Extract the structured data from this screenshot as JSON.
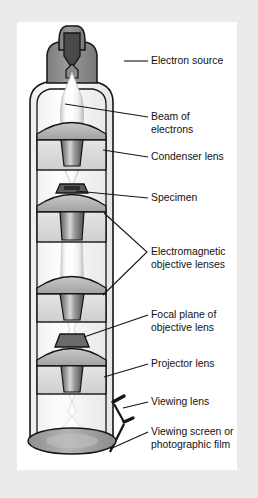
{
  "figure": {
    "panel_background": "#ffffff",
    "page_background": "#ebebeb",
    "ink_color": "#151515"
  },
  "palette": {
    "ink": "#151515",
    "panel": "#ffffff",
    "page": "#ebebeb",
    "housing_gray": "#8c8c8c",
    "filament_dark": "#4a4a4a",
    "lens_block": "#d6d6d6",
    "lens_block_shadow": "#b9b9b9",
    "dome_gray": "#b5b5b5",
    "bore_dark": "#6e6e6e",
    "beam_light": "#f4f4f4",
    "screen_gray": "#9a9a9a",
    "column_wall": "#f7f7f7"
  },
  "labels": [
    {
      "id": "electron-source",
      "lines": [
        "Electron source"
      ],
      "text_x": 151,
      "text_y": 64,
      "leader": "M124,61 L148,61"
    },
    {
      "id": "beam-of-electrons",
      "lines": [
        "Beam of",
        "electrons"
      ],
      "text_x": 151,
      "text_y": 120,
      "leader": "M65,104 L148,117"
    },
    {
      "id": "condenser-lens",
      "lines": [
        "Condenser lens"
      ],
      "text_x": 151,
      "text_y": 160,
      "leader": "M103,150 L148,157"
    },
    {
      "id": "specimen",
      "lines": [
        "Specimen"
      ],
      "text_x": 151,
      "text_y": 201,
      "leader": "M76,191 L148,198"
    },
    {
      "id": "electromagnetic-objective-lenses",
      "lines": [
        "Electromagnetic",
        "objective lenses"
      ],
      "text_x": 151,
      "text_y": 255,
      "leader": "M104,213 L147,252 L103,295"
    },
    {
      "id": "focal-plane-of-objective-lens",
      "lines": [
        "Focal plane of",
        "objective lens"
      ],
      "text_x": 151,
      "text_y": 318,
      "leader": "M84,337 L148,315"
    },
    {
      "id": "projector-lens",
      "lines": [
        "Projector lens"
      ],
      "text_x": 151,
      "text_y": 367,
      "leader": "M104,377 L148,364"
    },
    {
      "id": "viewing-lens",
      "lines": [
        "Viewing lens"
      ],
      "text_x": 151,
      "text_y": 405,
      "leader": "M123,408 L148,402"
    },
    {
      "id": "viewing-screen-or-photographic-film",
      "lines": [
        "Viewing screen or",
        "photographic film"
      ],
      "text_x": 151,
      "text_y": 435,
      "leader": "M110,449 L148,432"
    }
  ],
  "parts": [
    {
      "id": "electron-source",
      "name": "Electron source"
    },
    {
      "id": "beam-of-electrons",
      "name": "Beam of electrons"
    },
    {
      "id": "condenser-lens",
      "name": "Condenser lens"
    },
    {
      "id": "specimen",
      "name": "Specimen"
    },
    {
      "id": "objective-lens-upper",
      "name": "Electromagnetic objective lens (upper)"
    },
    {
      "id": "objective-lens-lower",
      "name": "Electromagnetic objective lens (lower)"
    },
    {
      "id": "focal-plane",
      "name": "Focal plane of objective lens"
    },
    {
      "id": "projector-lens",
      "name": "Projector lens"
    },
    {
      "id": "viewing-lens",
      "name": "Viewing lens"
    },
    {
      "id": "viewing-screen",
      "name": "Viewing screen or photographic film"
    },
    {
      "id": "column",
      "name": "Microscope column"
    }
  ]
}
